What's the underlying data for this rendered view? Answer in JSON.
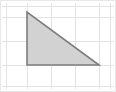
{
  "figure": {
    "width": 116,
    "height": 92,
    "background_color": "#ffffff",
    "border_color": "#e8e8e8"
  },
  "chart_data": {
    "type": "scatter",
    "xlabel": "",
    "ylabel": "",
    "grid": true,
    "legend_position": "none",
    "grid_spec": {
      "cell_size_px": 24,
      "vertical_line_x": [
        6,
        27,
        51,
        75,
        99,
        110
      ],
      "horizontal_line_y": [
        6,
        17,
        41,
        65,
        86
      ],
      "line_color": "#e3e3e6",
      "line_width_px": 1
    },
    "shapes": [
      {
        "name": "right-triangle",
        "type": "polygon",
        "vertices": [
          {
            "label": "apex",
            "x": 27,
            "y": 12
          },
          {
            "label": "right-angle",
            "x": 27,
            "y": 65
          },
          {
            "label": "base-right",
            "x": 99,
            "y": 65
          }
        ],
        "fill_color": "#d2d2d2",
        "fill_opacity": 1,
        "stroke_color": "#7d7d7d",
        "stroke_width_px": 1.6,
        "base_length_cells": 3,
        "height_length_cells": 2.2,
        "right_angle_at": "bottom-left"
      }
    ],
    "annotations": []
  }
}
